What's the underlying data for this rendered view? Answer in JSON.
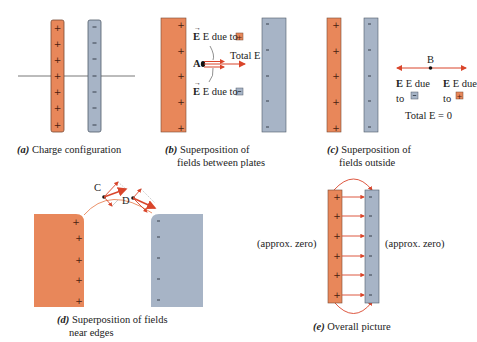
{
  "colors": {
    "positive_plate": "#e8875a",
    "negative_plate": "#a7b4c6",
    "field_arrow": "#d9452b",
    "outline": "#555555"
  },
  "panels": {
    "a": {
      "letter": "(a)",
      "caption": "Charge configuration",
      "charges_pos": "+",
      "charges_neg": "-"
    },
    "b": {
      "letter": "(b)",
      "caption_line1": "Superposition of",
      "caption_line2": "fields between plates",
      "point_label": "A",
      "label_top": "E due to",
      "label_bottom": "E due to",
      "label_total": "Total E"
    },
    "c": {
      "letter": "(c)",
      "caption_line1": "Superposition of",
      "caption_line2": "fields outside",
      "point_label": "B",
      "label_left_1": "E due",
      "label_left_2": "to",
      "label_right_1": "E due",
      "label_right_2": "to",
      "label_total": "Total E = 0"
    },
    "d": {
      "letter": "(d)",
      "caption_line1": "Superposition of fields",
      "caption_line2": "near edges",
      "point_c": "C",
      "point_d": "D"
    },
    "e": {
      "letter": "(e)",
      "caption": "Overall picture",
      "left_label": "(approx. zero)",
      "right_label": "(approx. zero)"
    }
  }
}
